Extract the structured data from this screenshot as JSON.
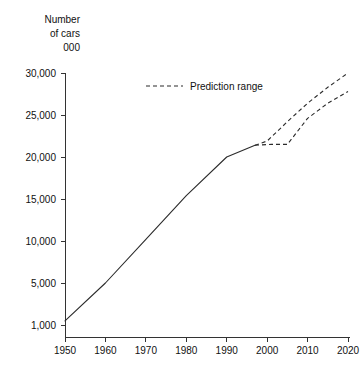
{
  "chart_data": {
    "type": "line",
    "title": "",
    "ylabel": "Number\nof cars\n000",
    "ylabel_lines": [
      "Number",
      "of cars",
      "000"
    ],
    "xlabel": "",
    "xlim": [
      1950,
      2020
    ],
    "ylim": [
      1000,
      30000
    ],
    "grid": false,
    "legend_position": "top-center",
    "y_ticks": [
      1000,
      5000,
      10000,
      15000,
      20000,
      25000,
      30000
    ],
    "y_tick_labels": [
      "1,000",
      "5,000",
      "10,000",
      "15,000",
      "20,000",
      "25,000",
      "30,000"
    ],
    "x_ticks": [
      1950,
      1960,
      1970,
      1980,
      1990,
      2000,
      2010,
      2020
    ],
    "x_tick_labels": [
      "1950",
      "1960",
      "1970",
      "1980",
      "1990",
      "2000",
      "2010",
      "2020"
    ],
    "series": [
      {
        "name": "Actual",
        "style": "solid",
        "x": [
          1950,
          1960,
          1970,
          1980,
          1990,
          1997
        ],
        "values": [
          1400,
          5000,
          10200,
          15400,
          20000,
          21400
        ]
      },
      {
        "name": "Prediction range upper",
        "style": "dashed",
        "x": [
          1997,
          2000,
          2005,
          2010,
          2015,
          2020
        ],
        "values": [
          21400,
          21900,
          24200,
          26400,
          28300,
          30000
        ]
      },
      {
        "name": "Prediction range lower",
        "style": "dashed",
        "x": [
          1997,
          2001,
          2005,
          2010,
          2015,
          2020
        ],
        "values": [
          21400,
          21500,
          21500,
          24600,
          26400,
          27800
        ]
      }
    ],
    "legend": [
      {
        "label": "Prediction range",
        "style": "dashed",
        "color": "#2b2b2b"
      }
    ],
    "colors": {
      "line": "#2b2b2b",
      "axis": "#333333",
      "text": "#111111",
      "background": "#ffffff"
    }
  }
}
